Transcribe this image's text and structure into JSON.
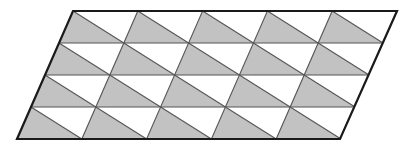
{
  "figure": {
    "name": "tiled-parallelogram",
    "title": "Parallelogram subdivided into congruent triangles",
    "canvas": {
      "width": 415,
      "height": 150
    },
    "geometry": {
      "outline_points": [
        {
          "label": "top-left",
          "x": 73,
          "y": 11
        },
        {
          "label": "top-right",
          "x": 397,
          "y": 11
        },
        {
          "label": "bottom-right",
          "x": 340,
          "y": 139
        },
        {
          "label": "bottom-left",
          "x": 17,
          "y": 139
        }
      ],
      "columns": 5,
      "rows": 4,
      "cell_width": 64.8,
      "cell_height": 32,
      "row_horizontal_shift": -14,
      "diagonal_direction": "bottom-left-to-top-right",
      "shaded_half": "lower-left",
      "triangles_total": 40,
      "shaded_triangles": 20,
      "white_triangles": 20
    },
    "colors": {
      "background": "#ffffff",
      "shaded_fill": "#c2c2c2",
      "white_fill": "#ffffff",
      "inner_stroke": "#555555",
      "outer_stroke": "#1a1a1a"
    },
    "strokes": {
      "outer_width": 2.2,
      "inner_width": 1.1
    }
  }
}
